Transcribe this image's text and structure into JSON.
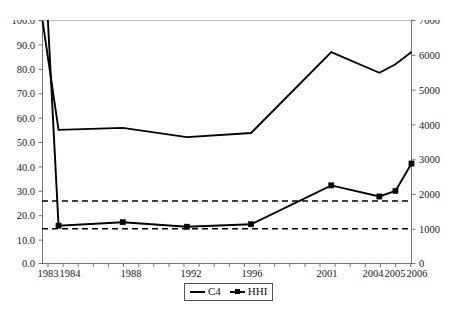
{
  "chart_data": {
    "type": "line",
    "title": "",
    "subtitle": "",
    "xlabel": "",
    "ylabel": "",
    "y2label": "",
    "grid": false,
    "legend_position": "bottom-center",
    "x": [
      1983,
      1984,
      1988,
      1992,
      1996,
      2001,
      2004,
      2005,
      2006
    ],
    "x_tick_labels": [
      "1983",
      "1984",
      "1988",
      "1992",
      "1996",
      "2001",
      "2004",
      "2005",
      "2006"
    ],
    "xlim": [
      1983,
      2006
    ],
    "ylim": [
      0.0,
      100.0
    ],
    "y_tick_labels": [
      "0.0",
      "10.0",
      "20.0",
      "30.0",
      "40.0",
      "50.0",
      "60.0",
      "70.0",
      "80.0",
      "90.0",
      "100.0"
    ],
    "y2lim": [
      0,
      7000
    ],
    "y2_tick_labels": [
      "0",
      "1000",
      "2000",
      "3000",
      "4000",
      "5000",
      "6000",
      "7000"
    ],
    "series": [
      {
        "name": "C4",
        "axis": "left",
        "marker": "none",
        "values": [
          100.0,
          55.0,
          55.8,
          52.0,
          53.7,
          87.0,
          78.5,
          82.0,
          87.0
        ]
      },
      {
        "name": "HHI",
        "axis": "right",
        "marker": "square",
        "values": [
          10000,
          1090,
          1190,
          1060,
          1130,
          2250,
          1930,
          2090,
          2880
        ]
      }
    ],
    "threshold_lines": [
      {
        "name": "upper-threshold",
        "axis": "right",
        "value": 1800,
        "style": "dashed"
      },
      {
        "name": "lower-threshold",
        "axis": "right",
        "value": 1000,
        "style": "dashed"
      }
    ],
    "legend": [
      "C4",
      "HHI"
    ]
  },
  "legend": {
    "c4_label": "C4",
    "hhi_label": "HHI"
  },
  "axes": {
    "left_ticks": [
      "100.0",
      "90.0",
      "80.0",
      "70.0",
      "60.0",
      "50.0",
      "40.0",
      "30.0",
      "20.0",
      "10.0",
      "0.0"
    ],
    "right_ticks": [
      "7000",
      "6000",
      "5000",
      "4000",
      "3000",
      "2000",
      "1000",
      "0"
    ],
    "x_ticks": [
      "1983",
      "1984",
      "1988",
      "1992",
      "1996",
      "2001",
      "2004",
      "2005",
      "2006"
    ]
  }
}
